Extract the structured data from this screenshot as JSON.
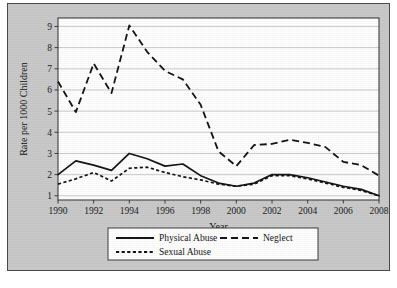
{
  "chart_data": {
    "type": "line",
    "title": "",
    "xlabel": "Year",
    "ylabel": "Rate per 1000 Children",
    "x": [
      1990,
      1991,
      1992,
      1993,
      1994,
      1995,
      1996,
      1997,
      1998,
      1999,
      2000,
      2001,
      2002,
      2003,
      2004,
      2005,
      2006,
      2007,
      2008
    ],
    "xlim": [
      1990,
      2008
    ],
    "ylim": [
      0.8,
      9.4
    ],
    "xticks": [
      1990,
      1992,
      1994,
      1996,
      1998,
      2000,
      2002,
      2004,
      2006,
      2008
    ],
    "xticklabels": [
      "1990",
      "1992",
      "1994",
      "1996",
      "1998",
      "2000",
      "2002",
      "2004",
      "2006",
      "2008"
    ],
    "yticks": [
      1,
      2,
      3,
      4,
      5,
      6,
      7,
      8,
      9
    ],
    "yticklabels": [
      "1",
      "2",
      "3",
      "4",
      "5",
      "6",
      "7",
      "8",
      "9"
    ],
    "grid": "horizontal",
    "legend_position": "below-center",
    "series": [
      {
        "name": "Physical Abuse",
        "linestyle": "solid",
        "color": "#111111",
        "values": [
          2.0,
          2.65,
          2.45,
          2.2,
          3.0,
          2.75,
          2.4,
          2.5,
          1.95,
          1.6,
          1.45,
          1.6,
          2.0,
          2.0,
          1.85,
          1.65,
          1.45,
          1.3,
          1.0
        ]
      },
      {
        "name": "Neglect",
        "linestyle": "long-dash",
        "color": "#111111",
        "values": [
          6.4,
          4.95,
          7.25,
          5.85,
          9.05,
          7.8,
          6.9,
          6.5,
          5.3,
          3.1,
          2.4,
          3.4,
          3.45,
          3.65,
          3.5,
          3.3,
          2.6,
          2.45,
          1.95
        ]
      },
      {
        "name": "Sexual Abuse",
        "linestyle": "short-dash",
        "color": "#111111",
        "values": [
          1.55,
          1.8,
          2.1,
          1.7,
          2.3,
          2.35,
          2.1,
          1.9,
          1.75,
          1.55,
          1.45,
          1.55,
          1.95,
          1.95,
          1.8,
          1.6,
          1.4,
          1.25,
          1.0
        ]
      }
    ]
  },
  "legend": {
    "entries": [
      {
        "label": "Physical Abuse",
        "style": "solid"
      },
      {
        "label": "Neglect",
        "style": "long-dash"
      },
      {
        "label": "Sexual Abuse",
        "style": "short-dash"
      }
    ]
  },
  "colors": {
    "figure_background": "#c9c9c9",
    "plot_background": "#ffffff",
    "grid": "#b4b4b4",
    "axis": "#2d2d2d",
    "ink": "#111111"
  }
}
